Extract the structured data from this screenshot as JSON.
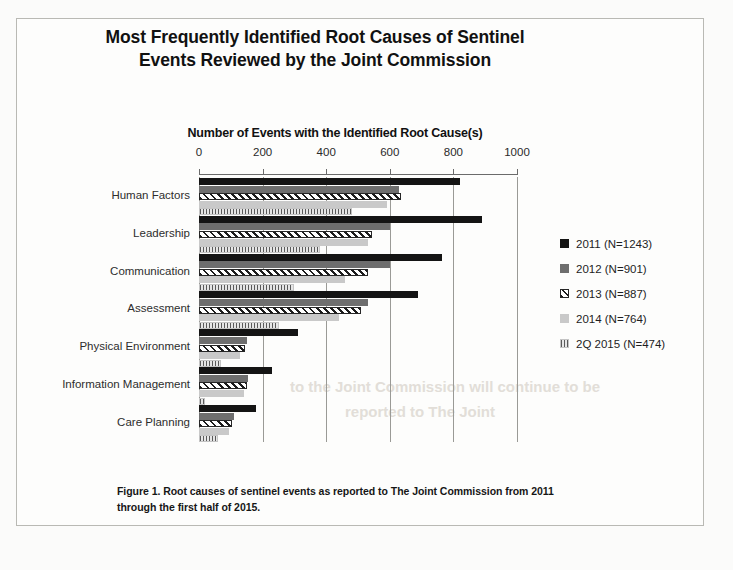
{
  "figure": {
    "title": "Most Frequently Identified Root Causes of Sentinel Events Reviewed by the Joint Commission",
    "caption": "Figure 1. Root causes of sentinel events as reported to The Joint Commission from 2011 through the first half of 2015."
  },
  "chart_data": {
    "type": "bar",
    "orientation": "horizontal",
    "title": "Most Frequently Identified Root Causes of Sentinel Events Reviewed by the Joint Commission",
    "xlabel": "Number of Events with the Identified Root Cause(s)",
    "ylabel": "",
    "xlim": [
      0,
      1000
    ],
    "xticks": [
      0,
      200,
      400,
      600,
      800,
      1000
    ],
    "xticklabels": [
      "0",
      "200",
      "400",
      "600",
      "800",
      "1000"
    ],
    "grid": true,
    "grid_axis": "x",
    "axis_position": "top",
    "legend_position": "right",
    "categories": [
      "Human Factors",
      "Leadership",
      "Communication",
      "Assessment",
      "Physical Environment",
      "Information Management",
      "Care Planning"
    ],
    "series": [
      {
        "name": "2011 (N=1243)",
        "year": "2011",
        "n": 1243,
        "pattern": "solid-black",
        "color": "#141414",
        "values": [
          820,
          890,
          765,
          690,
          310,
          230,
          180
        ]
      },
      {
        "name": "2012 (N=901)",
        "year": "2012",
        "n": 901,
        "pattern": "solid-gray",
        "color": "#6e6e6e",
        "values": [
          630,
          600,
          600,
          530,
          150,
          155,
          110
        ]
      },
      {
        "name": "2013 (N=887)",
        "year": "2013",
        "n": 887,
        "pattern": "diagonal-hatch",
        "color": "#1c1c1c",
        "values": [
          635,
          545,
          530,
          510,
          145,
          150,
          105
        ]
      },
      {
        "name": "2014 (N=764)",
        "year": "2014",
        "n": 764,
        "pattern": "solid-light-gray",
        "color": "#c9c9c9",
        "values": [
          590,
          530,
          460,
          440,
          130,
          140,
          95
        ]
      },
      {
        "name": "2Q 2015 (N=474)",
        "year": "2Q 2015",
        "n": 474,
        "pattern": "vertical-hatch",
        "color": "#5a5a5a",
        "values": [
          480,
          380,
          300,
          250,
          70,
          20,
          60
        ]
      }
    ]
  },
  "ghost_text": {
    "line1": "to the Joint Commission will continue to be",
    "line2": "reported to The Joint"
  }
}
